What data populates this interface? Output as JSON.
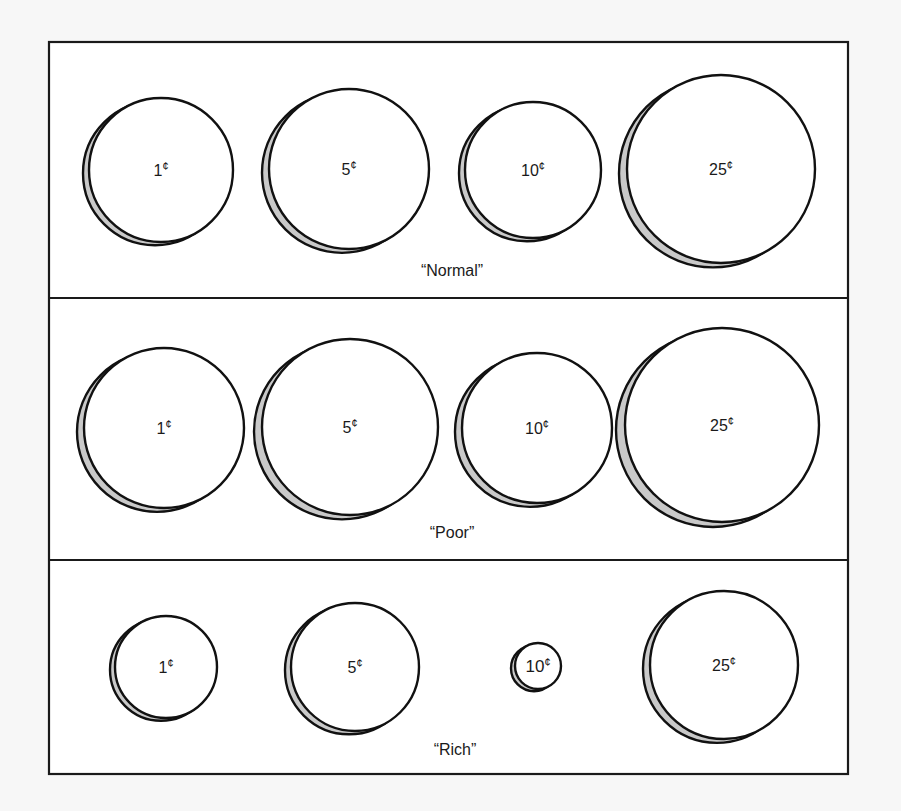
{
  "figure": {
    "colors": {
      "page_background": "#f7f7f7",
      "panel_background": "#ffffff",
      "stroke": "#111111",
      "coin_shadow": "#c9c9c9"
    },
    "frame": {
      "x": 49,
      "y": 42,
      "width": 799,
      "height": 732
    },
    "dividers": [
      298,
      560
    ],
    "panels": [
      {
        "label": "“Normal”",
        "label_position": {
          "x": 452,
          "y": 276
        },
        "coins": [
          {
            "value": "1",
            "unit": "¢",
            "cx": 161,
            "cy": 170,
            "r": 72
          },
          {
            "value": "5",
            "unit": "¢",
            "cx": 349,
            "cy": 169,
            "r": 80
          },
          {
            "value": "10",
            "unit": "¢",
            "cx": 533,
            "cy": 170,
            "r": 68
          },
          {
            "value": "25",
            "unit": "¢",
            "cx": 721,
            "cy": 169,
            "r": 94
          }
        ]
      },
      {
        "label": "“Poor”",
        "label_position": {
          "x": 452,
          "y": 538
        },
        "coins": [
          {
            "value": "1",
            "unit": "¢",
            "cx": 164,
            "cy": 428,
            "r": 80
          },
          {
            "value": "5",
            "unit": "¢",
            "cx": 350,
            "cy": 427,
            "r": 88
          },
          {
            "value": "10",
            "unit": "¢",
            "cx": 537,
            "cy": 428,
            "r": 75
          },
          {
            "value": "25",
            "unit": "¢",
            "cx": 722,
            "cy": 425,
            "r": 97
          }
        ]
      },
      {
        "label": "“Rich”",
        "label_position": {
          "x": 455,
          "y": 755
        },
        "coins": [
          {
            "value": "1",
            "unit": "¢",
            "cx": 166,
            "cy": 667,
            "r": 51
          },
          {
            "value": "5",
            "unit": "¢",
            "cx": 355,
            "cy": 667,
            "r": 64
          },
          {
            "value": "10",
            "unit": "¢",
            "cx": 538,
            "cy": 666,
            "r": 23
          },
          {
            "value": "25",
            "unit": "¢",
            "cx": 724,
            "cy": 665,
            "r": 74
          }
        ]
      }
    ]
  }
}
